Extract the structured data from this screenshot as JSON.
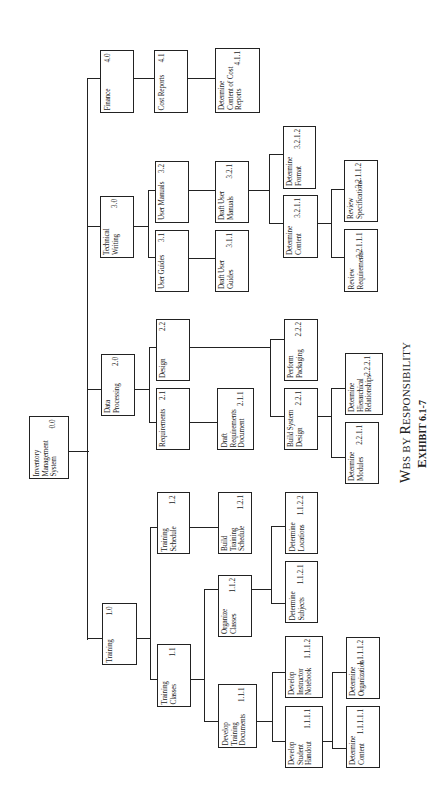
{
  "title": "WBS by Responsibility",
  "caption": {
    "line1_parts": [
      "W",
      "BS BY ",
      "R",
      "ESPONSIBILITY"
    ],
    "line2_parts": [
      "E",
      "XHIBIT 6.1-7"
    ]
  },
  "nodes": {
    "root": {
      "label": "Inventory\nManagement\nSystem",
      "code": "0.0"
    },
    "n1_0": {
      "label": "Training",
      "code": "1.0"
    },
    "n1_1": {
      "label": "Training\nClasses",
      "code": "1.1"
    },
    "n1_1_1": {
      "label": "Develop\nTraining\nDocuments",
      "code": "1.1.1"
    },
    "n1_1_1_1": {
      "label": "Develop\nStudent\nHandout",
      "code": "1.1.1.1"
    },
    "n1_1_1_1_1": {
      "label": "Determine\nContent",
      "code": "1.1.1.1.1"
    },
    "n1_1_1_1_2": {
      "label": "Determine\nOrganization",
      "code": "1.1.1.1.2"
    },
    "n1_1_1_2": {
      "label": "Develop\nInstructor\nNotebook",
      "code": "1.1.1.2"
    },
    "n1_1_2": {
      "label": "Organize\nClasses",
      "code": "1.1.2"
    },
    "n1_1_2_1": {
      "label": "Determine\nSubjects",
      "code": "1.1.2.1"
    },
    "n1_1_2_2": {
      "label": "Determine\nLocations",
      "code": "1.1.2.2"
    },
    "n1_2": {
      "label": "Training\nSchedule",
      "code": "1.2"
    },
    "n1_2_1": {
      "label": "Build\nTraining\nSchedule",
      "code": "1.2.1"
    },
    "n2_0": {
      "label": "Data\nProcessing",
      "code": "2.0"
    },
    "n2_1": {
      "label": "Requirements",
      "code": "2.1"
    },
    "n2_1_1": {
      "label": "Draft\nRequirements\nDocument",
      "code": "2.1.1"
    },
    "n2_2": {
      "label": "Design",
      "code": "2.2"
    },
    "n2_2_1": {
      "label": "Build System\nDesign",
      "code": "2.2.1"
    },
    "n2_2_1_1": {
      "label": "Determine\nModules",
      "code": "2.2.1.1"
    },
    "n2_2_2_1": {
      "label": "Determine\nHierarchical\nRelationships",
      "code": "2.2.2.1"
    },
    "n2_2_2": {
      "label": "Perform\nPackaging",
      "code": "2.2.2"
    },
    "n3_0": {
      "label": "Technical\nWriting",
      "code": "3.0"
    },
    "n3_1": {
      "label": "User Guides",
      "code": "3.1"
    },
    "n3_1_1": {
      "label": "Draft User\nGuides",
      "code": "3.1.1"
    },
    "n3_2": {
      "label": "User Manuals",
      "code": "3.2"
    },
    "n3_2_1": {
      "label": "Draft User\nManuals",
      "code": "3.2.1"
    },
    "n3_2_1_1": {
      "label": "Determine\nContent",
      "code": "3.2.1.1"
    },
    "n3_2_1_1_1": {
      "label": "Review\nRequirements",
      "code": "3.2.1.1.1"
    },
    "n3_2_1_1_2": {
      "label": "Review\nSpecifications",
      "code": "3.2.1.1.2"
    },
    "n3_2_1_2": {
      "label": "Determine\nFormat",
      "code": "3.2.1.2"
    },
    "n4_0": {
      "label": "Finance",
      "code": "4.0"
    },
    "n4_1": {
      "label": "Cost Reports",
      "code": "4.1"
    },
    "n4_1_1": {
      "label": "Determine\nContent of Cost\nReports",
      "code": "4.1.1"
    }
  }
}
